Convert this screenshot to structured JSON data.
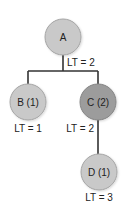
{
  "diagram": {
    "type": "tree",
    "colors": {
      "node_light": "#c9c9c9",
      "node_dark": "#9c9c9c",
      "node_stroke": "#a0a0a0",
      "edge": "#333333"
    },
    "nodes": [
      {
        "id": "A",
        "label": "A",
        "lt_label": "LT = 2"
      },
      {
        "id": "B",
        "label": "B (1)",
        "lt_label": "LT = 1"
      },
      {
        "id": "C",
        "label": "C (2)",
        "lt_label": "LT = 2"
      },
      {
        "id": "D",
        "label": "D (1)",
        "lt_label": "LT = 3"
      }
    ],
    "edges": [
      {
        "from": "A",
        "to": "B"
      },
      {
        "from": "A",
        "to": "C"
      },
      {
        "from": "C",
        "to": "D"
      }
    ]
  }
}
